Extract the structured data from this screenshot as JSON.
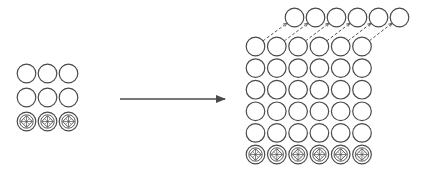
{
  "diagram": {
    "colors": {
      "stroke": "#4a4a4a",
      "background": "#ffffff",
      "dashed": "#555555"
    },
    "left_grid": {
      "cols": 3,
      "rows": 3,
      "x0": 26.5,
      "y0": 73.5,
      "dx": 21,
      "dy": 24,
      "r": 9.3,
      "ornamented_rows": [
        2
      ]
    },
    "arrow": {
      "x1": 120,
      "y1": 99,
      "x2": 225,
      "y2": 99
    },
    "right_grid": {
      "cols": 6,
      "rows": 6,
      "x0": 255.5,
      "y0": 46.5,
      "dx": 21.3,
      "dy": 21.6,
      "r": 9.3,
      "ornamented_rows": [
        5
      ]
    },
    "top_row": {
      "count": 6,
      "x0": 294.5,
      "y0": 17.5,
      "dx": 21,
      "r": 9.3
    }
  }
}
